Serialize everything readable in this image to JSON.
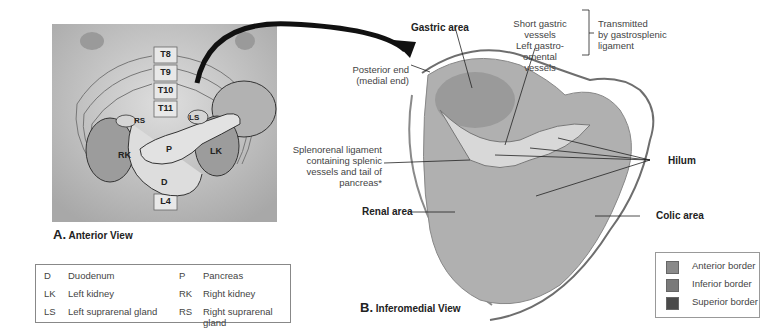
{
  "panel_a": {
    "letter": "A.",
    "title": "Anterior View",
    "vertebrae": [
      "T8",
      "T9",
      "T10",
      "T11",
      "L4"
    ],
    "organ_labels": {
      "RS": "RS",
      "LS": "LS",
      "RK": "RK",
      "P": "P",
      "LK": "LK",
      "D": "D"
    }
  },
  "key": [
    {
      "abbr": "D",
      "name": "Duodenum"
    },
    {
      "abbr": "P",
      "name": "Pancreas"
    },
    {
      "abbr": "LK",
      "name": "Left kidney"
    },
    {
      "abbr": "RK",
      "name": "Right kidney"
    },
    {
      "abbr": "LS",
      "name": "Left suprarenal gland"
    },
    {
      "abbr": "RS",
      "name": "Right suprarenal gland"
    }
  ],
  "panel_b": {
    "letter": "B.",
    "title": "Inferomedial View",
    "labels": {
      "gastric_area": "Gastric area",
      "posterior_end_1": "Posterior end",
      "posterior_end_2": "(medial end)",
      "vessels_1": "Short gastric vessels",
      "vessels_2": "Left gastro-omental",
      "vessels_3": "vessels",
      "transmitted_1": "Transmitted",
      "transmitted_2": "by gastrosplenic",
      "transmitted_3": "ligament",
      "splenorenal_1": "Splenorenal ligament",
      "splenorenal_2": "containing splenic",
      "splenorenal_3": "vessels and tail of",
      "splenorenal_4": "pancreas*",
      "hilum": "Hilum",
      "renal_area": "Renal area",
      "colic_area": "Colic area"
    }
  },
  "border_legend": [
    {
      "label": "Anterior border",
      "color": "#8a8a8a"
    },
    {
      "label": "Inferior border",
      "color": "#7a7a7a"
    },
    {
      "label": "Superior border",
      "color": "#4a4a4a"
    }
  ],
  "colors": {
    "arrow": "#111111",
    "border_line": "#6e6e6e",
    "body_bg": "#bdbdbd",
    "spleen": "#a9a9a9"
  }
}
